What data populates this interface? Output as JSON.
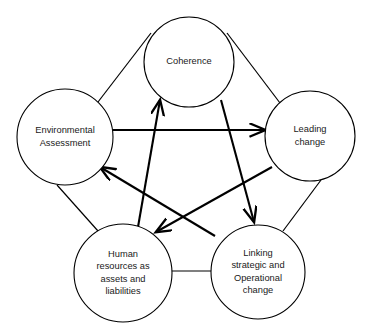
{
  "diagram": {
    "type": "circular-node-pentagon-diagram",
    "background_color": "#ffffff",
    "stroke_color": "#000000",
    "text_color": "#1a1a1a",
    "nodes": [
      {
        "id": "coherence",
        "label": "Coherence",
        "lines": [
          "Coherence"
        ],
        "cx": 189,
        "cy": 62,
        "r": 45
      },
      {
        "id": "environmental-assessment",
        "label": "Environmental Assessment",
        "lines": [
          "Environmental",
          "Assessment"
        ],
        "cx": 65,
        "cy": 137,
        "r": 48
      },
      {
        "id": "leading-change",
        "label": "Leading change",
        "lines": [
          "Leading",
          "change"
        ],
        "cx": 310,
        "cy": 136,
        "r": 45
      },
      {
        "id": "human-resources",
        "label": "Human resources as assets and liabilities",
        "lines": [
          "Human",
          "resources as",
          "assets and",
          "liabilities"
        ],
        "cx": 123,
        "cy": 273,
        "r": 49
      },
      {
        "id": "linking-strategic-operational",
        "label": "Linking strategic and Operational change",
        "lines": [
          "Linking",
          "strategic and",
          "Operational",
          "change"
        ],
        "cx": 258,
        "cy": 272,
        "r": 47
      }
    ],
    "perimeter_edges": [
      {
        "id": "env-to-coherence",
        "from": "environmental-assessment",
        "to": "coherence",
        "x1": 98,
        "y1": 102,
        "x2": 151,
        "y2": 33
      },
      {
        "id": "coherence-to-leading",
        "from": "coherence",
        "to": "leading-change",
        "x1": 227,
        "y1": 33,
        "x2": 280,
        "y2": 103
      },
      {
        "id": "env-to-human",
        "from": "environmental-assessment",
        "to": "human-resources",
        "x1": 57,
        "y1": 185,
        "x2": 98,
        "y2": 231
      },
      {
        "id": "leading-to-linking",
        "from": "leading-change",
        "to": "linking-strategic-operational",
        "x1": 321,
        "y1": 180,
        "x2": 283,
        "y2": 231
      },
      {
        "id": "human-to-linking",
        "from": "human-resources",
        "to": "linking-strategic-operational",
        "x1": 172,
        "y1": 271,
        "x2": 211,
        "y2": 271
      }
    ],
    "arrows": [
      {
        "id": "env-to-leading-arrow",
        "from": "environmental-assessment",
        "to": "leading-change",
        "x1": 113,
        "y1": 130,
        "x2": 265,
        "y2": 130
      },
      {
        "id": "human-to-coherence-arrow",
        "from": "human-resources",
        "to": "coherence",
        "x1": 138,
        "y1": 227,
        "x2": 160,
        "y2": 100
      },
      {
        "id": "coherence-to-linking-arrow",
        "from": "coherence",
        "to": "linking-strategic-operational",
        "x1": 221,
        "y1": 100,
        "x2": 254,
        "y2": 222
      },
      {
        "id": "linking-to-env-arrow",
        "from": "linking-strategic-operational",
        "to": "environmental-assessment",
        "x1": 215,
        "y1": 236,
        "x2": 100,
        "y2": 167
      },
      {
        "id": "leading-to-human-arrow",
        "from": "leading-change",
        "to": "human-resources",
        "x1": 272,
        "y1": 167,
        "x2": 156,
        "y2": 232
      }
    ]
  }
}
